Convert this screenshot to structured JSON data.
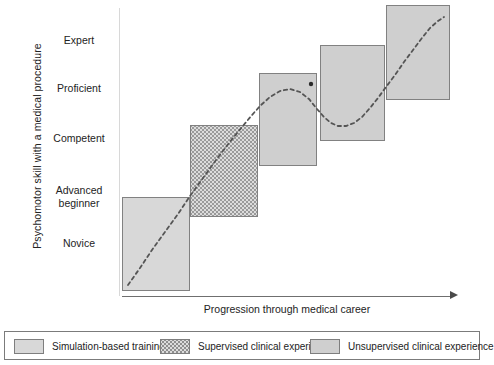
{
  "figure": {
    "y_axis_title": "Psychomotor skill with a medical procedure",
    "x_axis_title": "Progression through medical career",
    "y_tick_labels": [
      {
        "label": "Expert",
        "y": 34
      },
      {
        "label": "Proficient",
        "y": 82
      },
      {
        "label": "Competent",
        "y": 132
      },
      {
        "label": "Advanced\nbeginner",
        "y": 184
      },
      {
        "label": "Novice",
        "y": 237
      }
    ]
  },
  "chart_data": {
    "type": "area",
    "title": "",
    "xlabel": "Progression through medical career",
    "ylabel": "Psychomotor skill with a medical procedure",
    "ylim": [
      0,
      5
    ],
    "ytick_labels": [
      "Novice",
      "Advanced beginner",
      "Competent",
      "Proficient",
      "Expert"
    ],
    "grid": false,
    "legend_position": "bottom",
    "legend": [
      {
        "key": "simulation",
        "label": "Simulation-based training",
        "pattern": "plain",
        "color": "#d8d8d8"
      },
      {
        "key": "supervised",
        "label": "Supervised clinical experience",
        "pattern": "dotted",
        "color": "#dcdcdc"
      },
      {
        "key": "unsupervised",
        "label": "Unsupervised clinical experience",
        "pattern": "solidgray",
        "color": "#cfcfcf"
      }
    ],
    "stage_boxes": [
      {
        "name": "box-1",
        "legend_key": "simulation",
        "pattern": "plain",
        "x": 122,
        "y": 197,
        "w": 68,
        "h": 94
      },
      {
        "name": "box-2",
        "legend_key": "supervised",
        "pattern": "dotted",
        "x": 190,
        "y": 125,
        "w": 68,
        "h": 92
      },
      {
        "name": "box-3",
        "legend_key": "unsupervised",
        "pattern": "solidgray",
        "x": 259,
        "y": 73,
        "w": 58,
        "h": 93
      },
      {
        "name": "box-4",
        "legend_key": "unsupervised",
        "pattern": "solidgray",
        "x": 320,
        "y": 45,
        "w": 65,
        "h": 96
      },
      {
        "name": "box-5",
        "legend_key": "unsupervised",
        "pattern": "solidgray",
        "x": 386,
        "y": 5,
        "w": 64,
        "h": 95
      }
    ],
    "curve": {
      "style": "dashed",
      "color": "#555555",
      "points": [
        [
          128,
          285
        ],
        [
          140,
          268
        ],
        [
          152,
          250
        ],
        [
          165,
          232
        ],
        [
          178,
          214
        ],
        [
          190,
          196
        ],
        [
          203,
          178
        ],
        [
          216,
          160
        ],
        [
          229,
          143
        ],
        [
          242,
          127
        ],
        [
          252,
          115
        ],
        [
          261,
          105
        ],
        [
          270,
          97
        ],
        [
          280,
          91
        ],
        [
          290,
          89
        ],
        [
          300,
          92
        ],
        [
          309,
          99
        ],
        [
          317,
          109
        ],
        [
          324,
          117
        ],
        [
          331,
          123
        ],
        [
          338,
          126
        ],
        [
          346,
          126
        ],
        [
          354,
          123
        ],
        [
          362,
          117
        ],
        [
          370,
          108
        ],
        [
          378,
          98
        ],
        [
          386,
          87
        ],
        [
          395,
          75
        ],
        [
          404,
          62
        ],
        [
          413,
          50
        ],
        [
          422,
          38
        ],
        [
          430,
          28
        ],
        [
          438,
          21
        ],
        [
          444,
          17
        ]
      ]
    },
    "marker": {
      "name": "peak-marker",
      "x": 311,
      "y": 84,
      "r": 2.2,
      "color": "#2b2b2b"
    }
  }
}
